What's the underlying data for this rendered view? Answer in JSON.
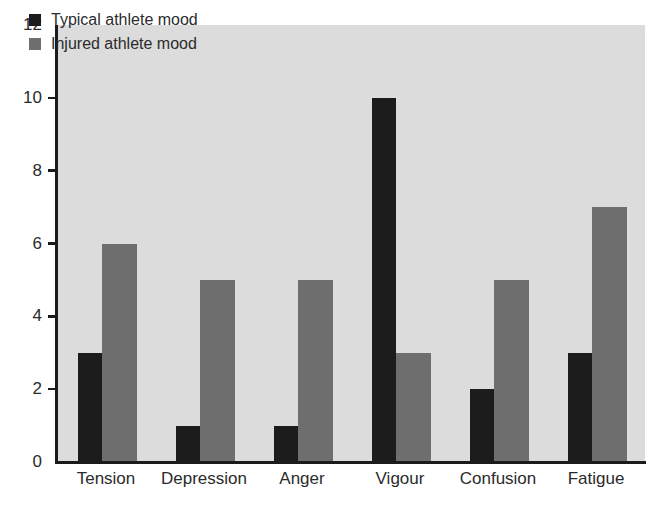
{
  "chart_data": {
    "type": "bar",
    "title": "",
    "subtitle": "",
    "xlabel": "",
    "ylabel": "",
    "categories": [
      "Tension",
      "Depression",
      "Anger",
      "Vigour",
      "Confusion",
      "Fatigue"
    ],
    "series": [
      {
        "name": "Typical athlete mood",
        "color": "#1c1c1c",
        "values": [
          3,
          1,
          1,
          10,
          2,
          3
        ]
      },
      {
        "name": "Injured athlete mood",
        "color": "#6e6e6e",
        "values": [
          6,
          5,
          5,
          3,
          5,
          7
        ]
      }
    ],
    "ylim": [
      0,
      12
    ],
    "yticks": [
      0,
      2,
      4,
      6,
      8,
      10,
      12
    ],
    "ytick_labels": [
      "0",
      "2",
      "4",
      "6",
      "8",
      "10",
      "12"
    ],
    "grid": false,
    "legend_position": "top-left",
    "plot_background": "#dcdcdc",
    "axis_color": "#1b1b1b",
    "annotations": []
  },
  "legend": {
    "items": [
      {
        "label": "Typical athlete mood",
        "swatch": "typical"
      },
      {
        "label": "Injured athlete mood",
        "swatch": "injured"
      }
    ]
  }
}
